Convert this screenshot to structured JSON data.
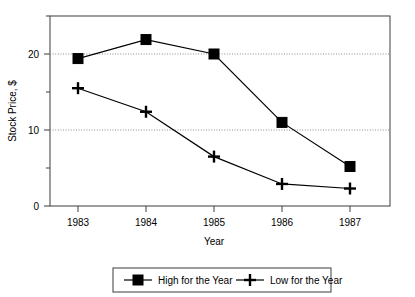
{
  "chart_data": {
    "type": "line",
    "title": "",
    "xlabel": "Year",
    "ylabel": "Stock Price, $",
    "categories": [
      "1983",
      "1984",
      "1985",
      "1986",
      "1987"
    ],
    "x": [
      1983,
      1984,
      1985,
      1986,
      1987
    ],
    "series": [
      {
        "name": "High for the Year",
        "marker": "filled-square",
        "color": "#000000",
        "values": [
          19.4,
          21.9,
          20.0,
          11.0,
          5.2
        ]
      },
      {
        "name": "Low for the Year",
        "marker": "plus",
        "color": "#000000",
        "values": [
          15.5,
          12.4,
          6.5,
          2.9,
          2.3
        ]
      }
    ],
    "ylim": [
      0,
      25
    ],
    "yticks_major": [
      0,
      10,
      20
    ],
    "yticks_minor": [
      5,
      15,
      25
    ],
    "ytick_labels": [
      "0",
      "10",
      "20"
    ],
    "grid": "horizontal-dotted-at-major-y",
    "legend_position": "bottom-outside",
    "frame": "full-box"
  },
  "legend": {
    "entries": [
      {
        "label": "High for the Year",
        "marker": "filled-square"
      },
      {
        "label": "Low for the Year",
        "marker": "plus"
      }
    ]
  }
}
